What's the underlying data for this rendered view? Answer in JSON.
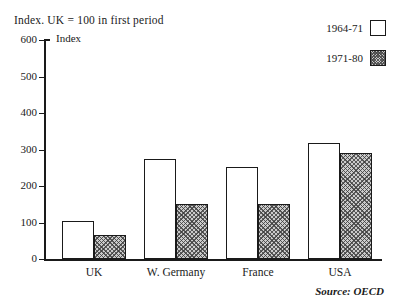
{
  "chart_data": {
    "type": "bar",
    "title": "Index. UK = 100 in first period",
    "ylabel": "Index",
    "xlabel": "",
    "ylim": [
      0,
      600
    ],
    "yticks": [
      0,
      100,
      200,
      300,
      400,
      500,
      600
    ],
    "ytick_labels": [
      "0",
      "100",
      "200",
      "300",
      "400",
      "500",
      "600"
    ],
    "grid": false,
    "legend_position": "top-right",
    "categories": [
      "UK",
      "W. Germany",
      "France",
      "USA"
    ],
    "series": [
      {
        "name": "1964-71",
        "values": [
          103,
          275,
          253,
          317
        ],
        "fill": "white"
      },
      {
        "name": "1971-80",
        "values": [
          65,
          150,
          150,
          290
        ],
        "fill": "hatched-gray"
      }
    ],
    "source": "Source: OECD"
  },
  "colors": {
    "ink": "#1a1a1a",
    "background": "#ffffff",
    "hatch_fill": "#c8c8c8"
  }
}
